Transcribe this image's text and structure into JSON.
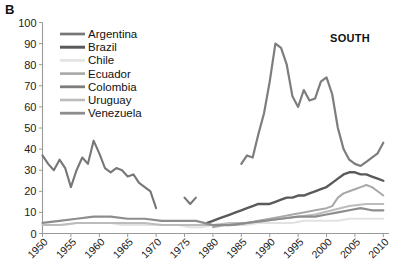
{
  "panel": {
    "label": "B"
  },
  "region": {
    "label": "SOUTH"
  },
  "chart_data": {
    "type": "line",
    "title": "",
    "subtitle": "",
    "xlabel": "",
    "ylabel": "",
    "xlim": [
      1950,
      2011
    ],
    "ylim": [
      0,
      100
    ],
    "grid": false,
    "legend_position": "top-left",
    "xticks": [
      "1950",
      "1955",
      "1960",
      "1965",
      "1970",
      "1975",
      "1980",
      "1985",
      "1990",
      "1995",
      "2000",
      "2005",
      "2010"
    ],
    "xtick_values": [
      1950,
      1955,
      1960,
      1965,
      1970,
      1975,
      1980,
      1985,
      1990,
      1995,
      2000,
      2005,
      2010
    ],
    "yticks": [
      "0",
      "10",
      "20",
      "30",
      "40",
      "50",
      "60",
      "70",
      "80",
      "90",
      "100"
    ],
    "ytick_values": [
      0,
      10,
      20,
      30,
      40,
      50,
      60,
      70,
      80,
      90,
      100
    ],
    "series": [
      {
        "name": "Argentina",
        "color": "#777777",
        "width": 2.1,
        "segments": [
          {
            "x": [
              1950,
              1951,
              1952,
              1953,
              1954,
              1955,
              1956,
              1957,
              1958,
              1959,
              1960,
              1961,
              1962,
              1963,
              1964,
              1965,
              1966,
              1967,
              1968,
              1969,
              1970
            ],
            "y": [
              37,
              33,
              30,
              35,
              31,
              22,
              30,
              36,
              33,
              44,
              38,
              31,
              29,
              31,
              30,
              27,
              28,
              24,
              22,
              20,
              12
            ]
          },
          {
            "x": [
              1975,
              1976,
              1977
            ],
            "y": [
              17,
              14,
              17
            ]
          }
        ]
      },
      {
        "name": "Brazil",
        "color": "#5a5a5a",
        "width": 2.4,
        "segments": [
          {
            "x": [
              1979,
              1980,
              1981,
              1982,
              1983,
              1984,
              1985,
              1986,
              1987,
              1988,
              1989,
              1990,
              1991,
              1992,
              1993,
              1994,
              1995,
              1996,
              1997,
              1998,
              1999,
              2000,
              2001,
              2002,
              2003,
              2004,
              2005,
              2006,
              2007,
              2008,
              2009,
              2010
            ],
            "y": [
              5,
              6,
              7,
              8,
              9,
              10,
              11,
              12,
              13,
              14,
              14,
              14,
              15,
              16,
              17,
              17,
              18,
              18,
              19,
              20,
              21,
              22,
              24,
              26,
              28,
              29,
              29,
              28,
              28,
              27,
              26,
              25
            ]
          }
        ]
      },
      {
        "name": "Chile",
        "color": "#e2e2e2",
        "width": 2.0,
        "segments": [
          {
            "x": [
              1950,
              1952,
              1954,
              1956,
              1958,
              1960,
              1962,
              1964,
              1966,
              1968,
              1970,
              1972,
              1974,
              1976,
              1978,
              1980,
              1982,
              1984,
              1986,
              1988,
              1990,
              1992,
              1994,
              1996,
              1998,
              2000,
              2002,
              2004,
              2006,
              2008,
              2010
            ],
            "y": [
              4,
              4,
              4,
              5,
              5,
              5,
              5,
              4,
              4,
              4,
              4,
              4,
              4,
              3,
              3,
              4,
              4,
              4,
              4,
              5,
              5,
              5,
              5,
              6,
              6,
              6,
              6,
              7,
              7,
              7,
              7
            ]
          }
        ]
      },
      {
        "name": "Ecuador",
        "color": "#a8a8a8",
        "width": 2.0,
        "segments": [
          {
            "x": [
              1980,
              1982,
              1984,
              1986,
              1988,
              1990,
              1992,
              1994,
              1996,
              1998,
              2000,
              2001,
              2002,
              2003,
              2004,
              2005,
              2006,
              2007,
              2008,
              2009,
              2010
            ],
            "y": [
              3,
              4,
              4,
              5,
              6,
              7,
              8,
              9,
              10,
              11,
              12,
              13,
              17,
              19,
              20,
              21,
              22,
              23,
              22,
              20,
              18
            ]
          }
        ]
      },
      {
        "name": "Colombia",
        "color": "#7d7d7d",
        "width": 2.2,
        "segments": [
          {
            "x": [
              1985,
              1986,
              1987,
              1988,
              1989,
              1990,
              1991,
              1992,
              1993,
              1994,
              1995,
              1996,
              1997,
              1998,
              1999,
              2000,
              2001,
              2002,
              2003,
              2004,
              2005,
              2006,
              2007,
              2008,
              2009,
              2010
            ],
            "y": [
              33,
              37,
              36,
              47,
              57,
              72,
              90,
              88,
              80,
              65,
              60,
              68,
              63,
              64,
              72,
              74,
              66,
              50,
              40,
              35,
              33,
              32,
              34,
              36,
              38,
              43
            ]
          }
        ]
      },
      {
        "name": "Uruguay",
        "color": "#bcbcbc",
        "width": 2.0,
        "segments": [
          {
            "x": [
              1950,
              1953,
              1956,
              1959,
              1962,
              1965,
              1968,
              1971,
              1974,
              1977,
              1980,
              1983,
              1986,
              1989,
              1992,
              1995,
              1998,
              2001,
              2004,
              2007,
              2010
            ],
            "y": [
              4,
              4,
              5,
              5,
              5,
              5,
              5,
              4,
              4,
              4,
              4,
              5,
              5,
              6,
              7,
              8,
              9,
              11,
              13,
              14,
              14
            ]
          }
        ]
      },
      {
        "name": "Venezuela",
        "color": "#8d8d8d",
        "width": 2.2,
        "segments": [
          {
            "x": [
              1950,
              1953,
              1956,
              1959,
              1962,
              1965,
              1968,
              1971,
              1974,
              1977,
              1980,
              1983,
              1986,
              1989,
              1992,
              1995,
              1998,
              2000,
              2002,
              2004,
              2006,
              2008,
              2010
            ],
            "y": [
              5,
              6,
              7,
              8,
              8,
              7,
              7,
              6,
              6,
              6,
              4,
              4,
              5,
              6,
              7,
              8,
              8,
              9,
              10,
              11,
              12,
              11,
              11
            ]
          }
        ]
      }
    ]
  },
  "legend": {
    "entries": [
      {
        "label": "Argentina"
      },
      {
        "label": "Brazil"
      },
      {
        "label": "Chile"
      },
      {
        "label": "Ecuador"
      },
      {
        "label": "Colombia"
      },
      {
        "label": "Uruguay"
      },
      {
        "label": "Venezuela"
      }
    ]
  }
}
